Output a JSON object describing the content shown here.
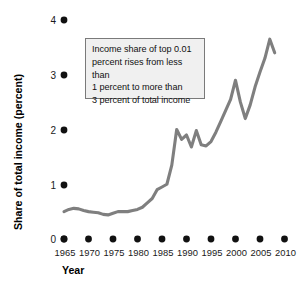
{
  "chart_data": {
    "type": "line",
    "title": "",
    "xlabel": "Year",
    "ylabel": "Share of total income (percent)",
    "xlim": [
      1965,
      2010
    ],
    "ylim": [
      0,
      4
    ],
    "grid": false,
    "legend_position": "none",
    "x_ticks": [
      "1965",
      "1970",
      "1975",
      "1980",
      "1985",
      "1990",
      "1995",
      "2000",
      "2005",
      "2010"
    ],
    "y_ticks": [
      "0",
      "1",
      "2",
      "3",
      "4"
    ],
    "line_color": "#7f7f7f",
    "annotation": "Income share of top 0.01\npercent rises from less than\n1 percent to more than\n3 percent of total income",
    "series": [
      {
        "name": "Income share of top 0.01 percent",
        "x": [
          1965,
          1966,
          1967,
          1968,
          1969,
          1970,
          1971,
          1972,
          1973,
          1974,
          1975,
          1976,
          1977,
          1978,
          1979,
          1980,
          1981,
          1982,
          1983,
          1984,
          1985,
          1986,
          1987,
          1988,
          1989,
          1990,
          1991,
          1992,
          1993,
          1994,
          1995,
          1996,
          1997,
          1998,
          1999,
          2000,
          2001,
          2002,
          2003,
          2004,
          2005,
          2006,
          2007,
          2008
        ],
        "values": [
          0.5,
          0.54,
          0.56,
          0.55,
          0.52,
          0.5,
          0.49,
          0.48,
          0.45,
          0.44,
          0.47,
          0.5,
          0.5,
          0.5,
          0.52,
          0.54,
          0.58,
          0.66,
          0.74,
          0.9,
          0.95,
          1.0,
          1.35,
          2.0,
          1.82,
          1.9,
          1.68,
          1.98,
          1.72,
          1.7,
          1.78,
          1.95,
          2.15,
          2.35,
          2.55,
          2.9,
          2.5,
          2.2,
          2.45,
          2.78,
          3.05,
          3.3,
          3.65,
          3.4
        ]
      }
    ]
  },
  "figure": {
    "y_axis_title": "Share of total income (percent)",
    "x_axis_title": "Year"
  }
}
